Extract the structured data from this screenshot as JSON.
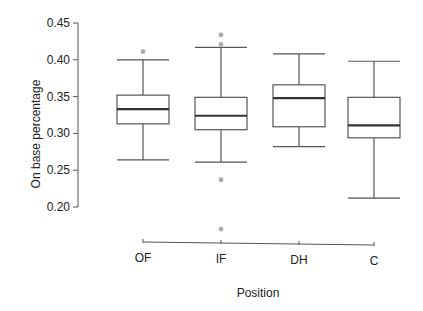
{
  "chart_data": {
    "type": "box",
    "title": "",
    "xlabel": "Position",
    "ylabel": "On base percentage",
    "ylim": [
      0.2,
      0.45
    ],
    "yticks": [
      "0.20",
      "0.25",
      "0.30",
      "0.35",
      "0.40",
      "0.45"
    ],
    "categories": [
      "OF",
      "IF",
      "DH",
      "C"
    ],
    "grid": false,
    "boxes": [
      {
        "category": "OF",
        "lower_whisker": 0.264,
        "q1": 0.313,
        "median": 0.333,
        "q3": 0.352,
        "upper_whisker": 0.4,
        "outliers": [
          0.411
        ]
      },
      {
        "category": "IF",
        "lower_whisker": 0.261,
        "q1": 0.305,
        "median": 0.324,
        "q3": 0.349,
        "upper_whisker": 0.417,
        "outliers": [
          0.434,
          0.421,
          0.237,
          0.17
        ]
      },
      {
        "category": "DH",
        "lower_whisker": 0.282,
        "q1": 0.309,
        "median": 0.348,
        "q3": 0.366,
        "upper_whisker": 0.408,
        "outliers": []
      },
      {
        "category": "C",
        "lower_whisker": 0.212,
        "q1": 0.294,
        "median": 0.311,
        "q3": 0.349,
        "upper_whisker": 0.398,
        "outliers": []
      }
    ],
    "colors": {
      "box_stroke": "#555555",
      "median": "#333333",
      "outlier": "#aaaaaa"
    }
  }
}
